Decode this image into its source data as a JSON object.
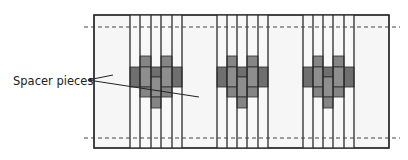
{
  "label": {
    "text": "Spacer pieces",
    "x": 13,
    "y": 74
  },
  "colors": {
    "outline": "#2a2a2a",
    "panel_fill": "#f6f6f6",
    "strip_fill": "#f8f8f8",
    "piece_dark": "#6f6f6f",
    "piece_mid": "#858585",
    "piece_light": "#8e8e8e",
    "dashed": "#444444"
  },
  "panel": {
    "x": 94,
    "y": 15,
    "w": 295,
    "h": 133
  },
  "dashed_lines": [
    {
      "y": 27,
      "x1": 84,
      "x2": 400
    },
    {
      "y": 138,
      "x1": 84,
      "x2": 400
    }
  ],
  "clusters": [
    {
      "lines": [
        130,
        140,
        151,
        161,
        172,
        182
      ]
    },
    {
      "lines": [
        217,
        227,
        237,
        247,
        258,
        268
      ]
    },
    {
      "lines": [
        303,
        313,
        323,
        333,
        344,
        354
      ]
    }
  ],
  "rows": {
    "upper_top": 56,
    "band_top": 67,
    "center_top": 77,
    "band_bottom": 87,
    "lower_bottom": 97,
    "center_bottom": 108
  },
  "leaders": [
    {
      "x1": 88,
      "y1": 80,
      "x2": 113,
      "y2": 75
    },
    {
      "x1": 88,
      "y1": 80,
      "x2": 199,
      "y2": 97
    }
  ]
}
